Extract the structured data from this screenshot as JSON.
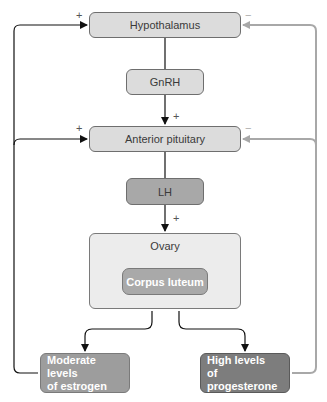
{
  "diagram": {
    "nodes": {
      "hypothalamus": "Hypothalamus",
      "gnrh": "GnRH",
      "anterior_pituitary": "Anterior pituitary",
      "lh": "LH",
      "ovary": "Ovary",
      "corpus_luteum": "Corpus luteum",
      "estrogen_line1": "Moderate levels",
      "estrogen_line2": "of estrogen",
      "progesterone_line1": "High levels",
      "progesterone_line2": "of progesterone"
    },
    "signs": {
      "plus": "+",
      "minus": "−"
    },
    "colors": {
      "stimulatory_arrow": "#111111",
      "inhibitory_arrow": "#a8a8a8",
      "light_box": "#dcdcdc",
      "medium_box": "#a8a8a8",
      "dark_box": "#7d7d7d"
    }
  }
}
